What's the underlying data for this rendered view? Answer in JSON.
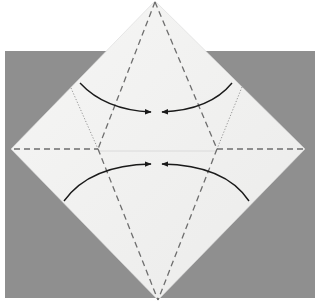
{
  "diagram": {
    "kind": "origami-fold-instruction",
    "colors": {
      "page_background": "#ffffff",
      "backdrop": "#8f8f8f",
      "paper": "#f1f1f0",
      "paper_shade": "#e6e6e5",
      "valley_fold": "#6e6e6e",
      "existing_crease": "#8a8a8a",
      "arrow": "#1a1a1a"
    },
    "folds": [
      {
        "name": "valley-fold-left-upper",
        "style": "dashed"
      },
      {
        "name": "valley-fold-right-upper",
        "style": "dashed"
      },
      {
        "name": "valley-fold-left-lower",
        "style": "dashed"
      },
      {
        "name": "valley-fold-right-lower",
        "style": "dashed"
      },
      {
        "name": "horizontal-fold-left",
        "style": "dashed"
      },
      {
        "name": "horizontal-fold-right",
        "style": "dashed"
      },
      {
        "name": "crease-left",
        "style": "dotted"
      },
      {
        "name": "crease-right",
        "style": "dotted"
      }
    ],
    "arrows": [
      {
        "name": "fold-arrow-top-left",
        "direction": "inward"
      },
      {
        "name": "fold-arrow-top-right",
        "direction": "inward"
      },
      {
        "name": "fold-arrow-bottom-left",
        "direction": "inward"
      },
      {
        "name": "fold-arrow-bottom-right",
        "direction": "inward"
      }
    ]
  }
}
